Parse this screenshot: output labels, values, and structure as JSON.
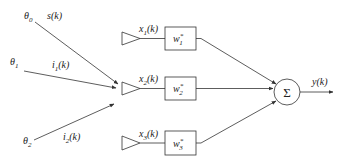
{
  "diagram": {
    "type": "adaptive beamformer / linear combiner",
    "sources": [
      {
        "angle_symbol": "θ",
        "angle_sub": "0",
        "signal_base": "s",
        "signal_sub": "",
        "signal_arg": "(k)"
      },
      {
        "angle_symbol": "θ",
        "angle_sub": "1",
        "signal_base": "i",
        "signal_sub": "1",
        "signal_arg": "(k)"
      },
      {
        "angle_symbol": "θ",
        "angle_sub": "2",
        "signal_base": "i",
        "signal_sub": "2",
        "signal_arg": "(k)"
      }
    ],
    "sensors": [
      {
        "signal_base": "x",
        "signal_sub": "1",
        "signal_arg": "(k)",
        "weight_base": "w",
        "weight_sub": "1",
        "weight_sup": "*"
      },
      {
        "signal_base": "x",
        "signal_sub": "2",
        "signal_arg": "(k)",
        "weight_base": "w",
        "weight_sub": "2",
        "weight_sup": "*"
      },
      {
        "signal_base": "x",
        "signal_sub": "3",
        "signal_arg": "(k)",
        "weight_base": "w",
        "weight_sub": "3",
        "weight_sup": "*"
      }
    ],
    "summer": {
      "symbol": "Σ"
    },
    "output": {
      "base": "y",
      "arg": "(k)"
    },
    "colors": {
      "stroke": "#333333",
      "background": "#ffffff"
    }
  }
}
